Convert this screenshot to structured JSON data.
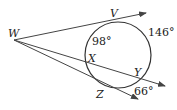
{
  "points": {
    "W": "W",
    "V": "V",
    "X": "X",
    "Y": "Y",
    "Z": "Z"
  },
  "arcs": {
    "VX": "98°",
    "VY": "146°",
    "YZ": "66°"
  }
}
